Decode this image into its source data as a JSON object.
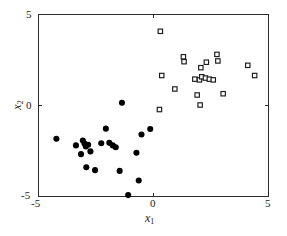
{
  "chart_data": {
    "type": "scatter",
    "title": "",
    "xlabel": "x_1",
    "ylabel": "x_2",
    "xlim": [
      -5,
      5
    ],
    "ylim": [
      -5,
      5
    ],
    "xticks": [
      -5,
      0,
      5
    ],
    "yticks": [
      -5,
      0,
      5
    ],
    "xtick_labels": [
      "-5",
      "0",
      "5"
    ],
    "ytick_labels": [
      "-5",
      "0",
      "5"
    ],
    "grid": false,
    "legend": false,
    "background": "#ffffff",
    "axis_color": "#2b2b2b",
    "series": [
      {
        "name": "class-1",
        "marker": "filled-circle",
        "color": "#000000",
        "marker_size": 4.1,
        "points": [
          [
            -4.2,
            -1.85
          ],
          [
            -3.35,
            -2.22
          ],
          [
            -3.13,
            -2.7
          ],
          [
            -3.05,
            -1.95
          ],
          [
            -2.98,
            -2.12
          ],
          [
            -2.92,
            -2.28
          ],
          [
            -2.82,
            -2.18
          ],
          [
            -2.9,
            -3.42
          ],
          [
            -2.72,
            -2.55
          ],
          [
            -2.52,
            -3.58
          ],
          [
            -2.25,
            -2.1
          ],
          [
            -2.05,
            -1.3
          ],
          [
            -1.9,
            -2.08
          ],
          [
            -1.75,
            -2.22
          ],
          [
            -1.62,
            -2.32
          ],
          [
            -1.45,
            -3.62
          ],
          [
            -1.35,
            0.12
          ],
          [
            -1.08,
            -4.95
          ],
          [
            -0.72,
            -2.62
          ],
          [
            -0.62,
            -4.15
          ],
          [
            -0.5,
            -1.62
          ],
          [
            -0.12,
            -1.32
          ]
        ]
      },
      {
        "name": "class-2",
        "marker": "open-square",
        "color": "#1a1a1a",
        "marker_size": 4.4,
        "points": [
          [
            0.32,
            4.05
          ],
          [
            0.28,
            -0.25
          ],
          [
            0.38,
            1.62
          ],
          [
            0.95,
            0.88
          ],
          [
            1.32,
            2.65
          ],
          [
            1.35,
            2.38
          ],
          [
            1.82,
            1.42
          ],
          [
            1.92,
            0.55
          ],
          [
            2.02,
            1.38
          ],
          [
            2.05,
            0.0
          ],
          [
            2.08,
            2.05
          ],
          [
            2.12,
            1.55
          ],
          [
            2.28,
            1.48
          ],
          [
            2.32,
            2.35
          ],
          [
            2.45,
            1.42
          ],
          [
            2.62,
            1.38
          ],
          [
            2.78,
            2.78
          ],
          [
            2.82,
            2.42
          ],
          [
            3.05,
            0.62
          ],
          [
            4.12,
            2.18
          ],
          [
            4.42,
            1.62
          ]
        ]
      }
    ]
  },
  "axes_geometry": {
    "plot_left": 38,
    "plot_right": 268,
    "plot_top": 14,
    "plot_bottom": 196
  },
  "labels": {
    "x_axis": "x",
    "x_axis_sub": "1",
    "y_axis": "x",
    "y_axis_sub": "2",
    "xtick_min": "-5",
    "xtick_mid": "0",
    "xtick_max": "5",
    "ytick_min": "-5",
    "ytick_mid": "0",
    "ytick_max": "5"
  }
}
